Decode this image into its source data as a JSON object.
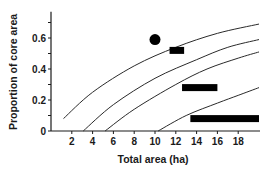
{
  "chart_data": {
    "type": "line",
    "title": "",
    "xlabel": "Total area (ha)",
    "ylabel": "Proportion of core area",
    "xlim": [
      0,
      20
    ],
    "ylim": [
      0,
      0.77
    ],
    "grid": false,
    "legend": null,
    "x_ticks": [
      2,
      4,
      6,
      8,
      10,
      12,
      14,
      16,
      18
    ],
    "x_tick_labels": [
      "2",
      "4",
      "6",
      "8",
      "10",
      "12",
      "14",
      "16",
      "18"
    ],
    "y_ticks": [
      0,
      0.1,
      0.2,
      0.3,
      0.4,
      0.5,
      0.6,
      0.7
    ],
    "y_tick_labels": [
      "0",
      "",
      "0.2",
      "",
      "0.4",
      "",
      "0.6",
      ""
    ],
    "series": [
      {
        "name": "curve-1",
        "x": [
          1.2,
          4,
          8,
          12,
          16,
          20
        ],
        "y": [
          0.08,
          0.25,
          0.42,
          0.54,
          0.63,
          0.69
        ]
      },
      {
        "name": "curve-2",
        "x": [
          3.1,
          6,
          10,
          14,
          17,
          20
        ],
        "y": [
          0.0,
          0.17,
          0.34,
          0.46,
          0.54,
          0.59
        ]
      },
      {
        "name": "curve-3",
        "x": [
          5.2,
          8,
          12,
          15,
          18,
          20
        ],
        "y": [
          0.0,
          0.14,
          0.3,
          0.4,
          0.47,
          0.51
        ]
      },
      {
        "name": "curve-4",
        "x": [
          10.3,
          13,
          16,
          18,
          20
        ],
        "y": [
          0.0,
          0.1,
          0.18,
          0.23,
          0.28
        ]
      }
    ],
    "markers": [
      {
        "shape": "circle",
        "x": 10.0,
        "y": 0.59
      },
      {
        "shape": "bar",
        "x_start": 11.4,
        "x_end": 12.8,
        "y": 0.52
      },
      {
        "shape": "bar",
        "x_start": 12.6,
        "x_end": 16.0,
        "y": 0.28
      },
      {
        "shape": "bar",
        "x_start": 13.4,
        "x_end": 20.0,
        "y": 0.08
      }
    ]
  },
  "layout": {
    "plot_left_px": 51,
    "plot_bottom_px": 131,
    "px_per_x": 10.4,
    "px_per_y": 155,
    "axis_color": "#1a1a1a",
    "line_color": "#2a2a2a"
  }
}
